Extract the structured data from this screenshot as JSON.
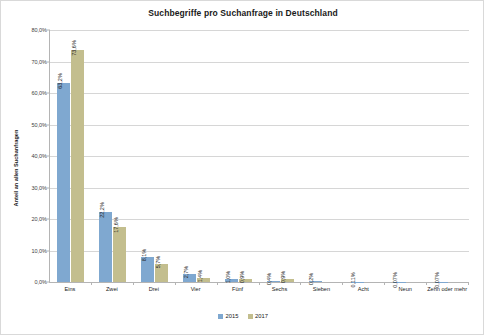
{
  "chart_data": {
    "type": "bar",
    "title": "Suchbegriffe pro Suchanfrage in Deutschland",
    "xlabel": "",
    "ylabel": "Anteil an allen Suchanfragen",
    "ylim": [
      0,
      80
    ],
    "grid": true,
    "legend_position": "bottom",
    "categories": [
      "Eins",
      "Zwei",
      "Drei",
      "Vier",
      "Fünf",
      "Sechs",
      "Sieben",
      "Acht",
      "Neun",
      "Zehn oder mehr"
    ],
    "ytick_labels": [
      "0,0%",
      "10,0%",
      "20,0%",
      "30,0%",
      "40,0%",
      "50,0%",
      "60,0%",
      "70,0%",
      "80,0%"
    ],
    "ytick_values": [
      0,
      10,
      20,
      30,
      40,
      50,
      60,
      70,
      80
    ],
    "series": [
      {
        "name": "2015",
        "color": "#7FA8D0",
        "values": [
          63.2,
          22.2,
          8.1,
          2.7,
          1.0,
          0.4,
          0.2,
          0.11,
          0.07,
          0.07
        ],
        "labels": [
          "63,2%",
          "22,2%",
          "8,1%",
          "2,7%",
          "1,0%",
          "0,4%",
          "0,2%",
          "0,11%",
          "0,07%",
          "0,07%"
        ]
      },
      {
        "name": "2017",
        "color": "#C3BE8E",
        "values": [
          73.6,
          17.6,
          5.7,
          1.4,
          0.9,
          0.9,
          0,
          0,
          0,
          0
        ],
        "labels": [
          "73,6%",
          "17,6%",
          "5,7%",
          "1,4%",
          "0,9%",
          "0,9%",
          "",
          "",
          "",
          ""
        ]
      }
    ]
  }
}
